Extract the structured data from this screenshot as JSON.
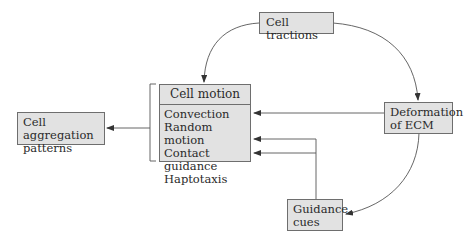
{
  "nodes": {
    "cell_tractions": {
      "label": "Cell tractions"
    },
    "cell_motion": {
      "title": "Cell motion",
      "items": [
        "Convection",
        "Random motion",
        "Contact guidance",
        "Haptotaxis"
      ]
    },
    "cell_aggregation": {
      "line1": "Cell aggregation",
      "line2": "patterns"
    },
    "deformation_ecm": {
      "line1": "Deformation",
      "line2": "of ECM"
    },
    "guidance_cues": {
      "line1": "Guidance",
      "line2": "cues"
    }
  },
  "edges": [
    {
      "from": "Cell tractions",
      "to": "Cell motion"
    },
    {
      "from": "Cell tractions",
      "to": "Deformation of ECM"
    },
    {
      "from": "Deformation of ECM",
      "to": "Convection"
    },
    {
      "from": "Deformation of ECM",
      "to": "Guidance cues"
    },
    {
      "from": "Guidance cues",
      "to": "Contact guidance"
    },
    {
      "from": "Guidance cues",
      "to": "Haptotaxis"
    },
    {
      "from": "Cell motion",
      "to": "Cell aggregation patterns"
    }
  ],
  "colors": {
    "box_fill": "#e2e2e2",
    "box_border": "#6e6e6e",
    "line": "#555555"
  }
}
